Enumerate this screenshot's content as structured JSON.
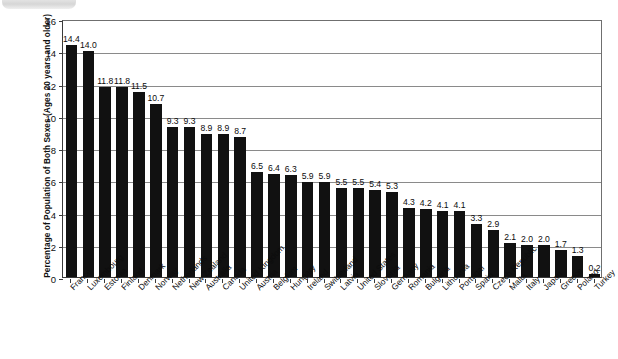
{
  "chart_data": {
    "type": "bar",
    "title": "",
    "subtitle": "",
    "xlabel": "",
    "ylabel": "Percentage of Population of Both Sexes (Ages 20 years and older)",
    "ylim": [
      0,
      16
    ],
    "ytick_labels": [
      "0",
      "2",
      "4",
      "6",
      "8",
      "10",
      "12",
      "14",
      "16"
    ],
    "ytick_values": [
      0,
      2,
      4,
      6,
      8,
      10,
      12,
      14,
      16
    ],
    "grid": "horizontal",
    "legend": "none",
    "bar_color": "#111111",
    "categories": [
      "France",
      "Luxembourg",
      "Estonia",
      "Finland",
      "Denmark",
      "Norway",
      "Netherlands",
      "New Zealand",
      "Australia",
      "Canada",
      "United Kingdom",
      "Austria",
      "Belgium",
      "Hungary",
      "Ireland",
      "Switzerland",
      "Latvia",
      "United States",
      "Slovenia",
      "Germany",
      "Romania",
      "Bulgaria",
      "Lithuania",
      "Portugal",
      "Spain",
      "Czech Republic",
      "Malta",
      "Italy",
      "Japan",
      "Greece",
      "Poland",
      "Turkey"
    ],
    "values": [
      14.4,
      14.0,
      11.8,
      11.8,
      11.5,
      10.7,
      9.3,
      9.3,
      8.9,
      8.9,
      8.7,
      6.5,
      6.4,
      6.3,
      5.9,
      5.9,
      5.5,
      5.5,
      5.4,
      5.3,
      4.3,
      4.2,
      4.1,
      4.1,
      3.3,
      2.9,
      2.1,
      2.0,
      2.0,
      1.7,
      1.3,
      0.2
    ],
    "value_labels": [
      "14.4",
      "14.0",
      "11.8",
      "11.8",
      "11.5",
      "10.7",
      "9.3",
      "9.3",
      "8.9",
      "8.9",
      "8.7",
      "6.5",
      "6.4",
      "6.3",
      "5.9",
      "5.9",
      "5.5",
      "5.5",
      "5.4",
      "5.3",
      "4.3",
      "4.2",
      "4.1",
      "4.1",
      "3.3",
      "2.9",
      "2.1",
      "2.0",
      "2.0",
      "1.7",
      "1.3",
      "0.2"
    ]
  }
}
